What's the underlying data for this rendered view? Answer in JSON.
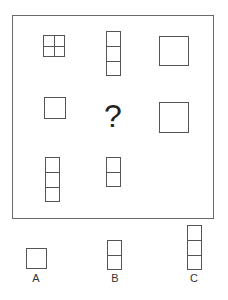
{
  "puzzle": {
    "question_mark": "?",
    "line_color": "#555555",
    "grid": [
      {
        "row": 1,
        "col": 1,
        "shape": "square-2x2-grid"
      },
      {
        "row": 1,
        "col": 2,
        "shape": "vertical-stack-3"
      },
      {
        "row": 1,
        "col": 3,
        "shape": "large-square"
      },
      {
        "row": 2,
        "col": 1,
        "shape": "medium-square"
      },
      {
        "row": 2,
        "col": 2,
        "shape": "question-mark"
      },
      {
        "row": 2,
        "col": 3,
        "shape": "large-square"
      },
      {
        "row": 3,
        "col": 1,
        "shape": "vertical-stack-3"
      },
      {
        "row": 3,
        "col": 2,
        "shape": "vertical-stack-2"
      },
      {
        "row": 3,
        "col": 3,
        "shape": "empty"
      }
    ]
  },
  "options": [
    {
      "label": "A",
      "shape": "medium-square"
    },
    {
      "label": "B",
      "shape": "vertical-stack-2"
    },
    {
      "label": "C",
      "shape": "vertical-stack-3"
    }
  ]
}
